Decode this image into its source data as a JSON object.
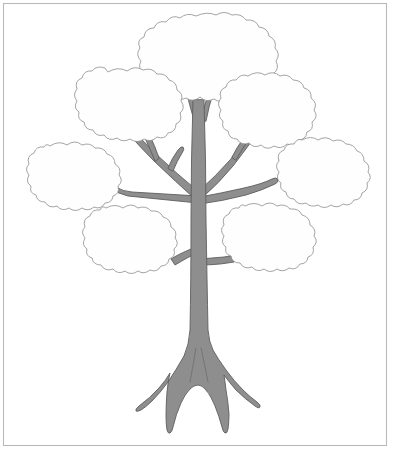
{
  "page": {
    "background_color": "#ffffff",
    "width": 396,
    "height": 453
  },
  "frame": {
    "name": "page-border",
    "stroke_color": "#b9b9b9",
    "x": 3,
    "y": 3,
    "width": 384,
    "height": 443
  },
  "tree": {
    "trunk_color": "#8e8e8e",
    "outline_color": "#5d5d5d",
    "foliage_fill": "#fefefe",
    "foliage_outline": "#8d8d8d",
    "trunk_label": "雲兒",
    "trunk_label_color": "#ffffff",
    "foliage_count": 7,
    "foliage_blobs": [
      {
        "id": "top-center",
        "label": ""
      },
      {
        "id": "upper-left",
        "label": ""
      },
      {
        "id": "upper-right",
        "label": ""
      },
      {
        "id": "mid-left",
        "label": ""
      },
      {
        "id": "mid-right",
        "label": ""
      },
      {
        "id": "lower-left",
        "label": ""
      },
      {
        "id": "lower-right",
        "label": ""
      }
    ]
  }
}
